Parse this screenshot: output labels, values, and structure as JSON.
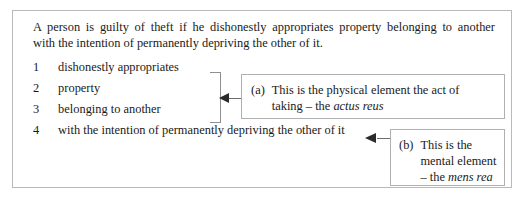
{
  "figure": {
    "statute": {
      "line1": "A person is guilty of theft if he dishonestly appropriates property belonging to another",
      "line2": "with the intention of permanently depriving the other of it."
    },
    "elements": [
      {
        "number": "1",
        "label": "dishonestly appropriates"
      },
      {
        "number": "2",
        "label": "property"
      },
      {
        "number": "3",
        "label": "belonging to another"
      },
      {
        "number": "4",
        "label": "with the intention of permanently depriving the other of it"
      }
    ],
    "callouts": [
      {
        "marker": "(a)",
        "line1_text": "This is the physical element the act of",
        "line2_text": "taking – the ",
        "line2_latin": "actus reus"
      },
      {
        "marker": "(b)",
        "line1_text": "This is the",
        "line2_text": "mental element",
        "line3_text": "– the ",
        "line3_latin": "mens rea"
      }
    ],
    "connectors": {
      "bracket_arrow": "left-arrow-icon",
      "item4_arrow": "left-arrow-icon"
    },
    "colors": {
      "frame_border": "#b9b9b9",
      "callout_border": "#b0b0b0",
      "bracket": "#8f8f8f",
      "arrow": "#2b2b2b",
      "text": "#1a1a1a",
      "background": "#ffffff"
    }
  }
}
